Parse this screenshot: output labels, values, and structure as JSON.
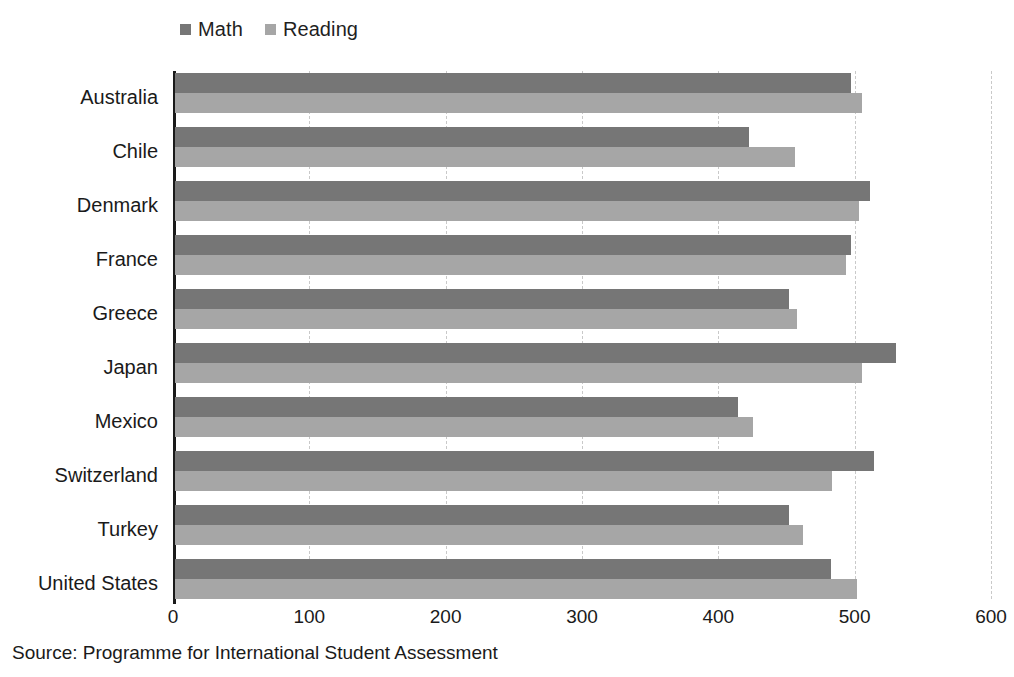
{
  "chart_data": {
    "type": "bar",
    "orientation": "horizontal",
    "title": "",
    "xlabel": "",
    "ylabel": "",
    "xlim": [
      0,
      600
    ],
    "xticks": [
      0,
      100,
      200,
      300,
      400,
      500,
      600
    ],
    "xtick_labels": [
      "0",
      "100",
      "200",
      "300",
      "400",
      "500",
      "600"
    ],
    "grid": true,
    "grid_axis": "x",
    "grid_style": "dashed",
    "legend_position": "top-left",
    "categories": [
      "Australia",
      "Chile",
      "Denmark",
      "France",
      "Greece",
      "Japan",
      "Mexico",
      "Switzerland",
      "Turkey",
      "United States"
    ],
    "series": [
      {
        "name": "Math",
        "color": "#767676",
        "values": [
          496,
          421,
          510,
          496,
          450,
          529,
          413,
          513,
          450,
          481
        ]
      },
      {
        "name": "Reading",
        "color": "#a6a6a6",
        "values": [
          504,
          455,
          502,
          492,
          456,
          504,
          424,
          482,
          461,
          500
        ]
      }
    ],
    "source": "Source: Programme for International Student Assessment"
  },
  "legend": {
    "items": [
      {
        "label": "Math",
        "color": "#767676"
      },
      {
        "label": "Reading",
        "color": "#a6a6a6"
      }
    ]
  },
  "colors": {
    "math": "#767676",
    "reading": "#a6a6a6",
    "axis": "#1a1a1a",
    "gridline": "#c9c9c9",
    "background": "#ffffff"
  },
  "footer": {
    "source": "Source: Programme for International Student Assessment"
  }
}
